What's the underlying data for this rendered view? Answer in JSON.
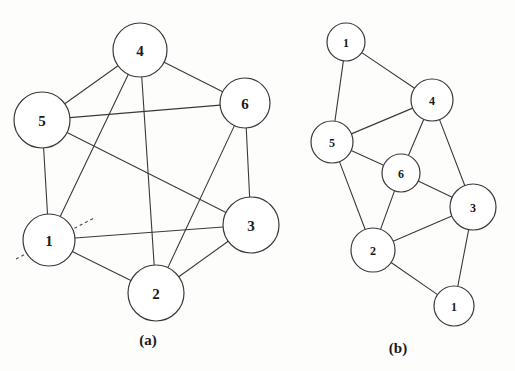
{
  "figure": {
    "background_color": "#fdfdfc",
    "stroke_color": "#3a3a3a",
    "node_fill": "#ffffff",
    "panels": [
      {
        "id": "panel-a",
        "caption": "(a)",
        "caption_pos": {
          "x": 148,
          "y": 345
        },
        "kind": "circular-layout-graph",
        "nodes": [
          {
            "id": "a4",
            "label": "4",
            "cx": 140,
            "cy": 50,
            "r": 27,
            "font_size": 15
          },
          {
            "id": "a5",
            "label": "5",
            "cx": 42,
            "cy": 120,
            "r": 28,
            "font_size": 15
          },
          {
            "id": "a6",
            "label": "6",
            "cx": 245,
            "cy": 103,
            "r": 25,
            "font_size": 15
          },
          {
            "id": "a3",
            "label": "3",
            "cx": 251,
            "cy": 225,
            "r": 28,
            "font_size": 15
          },
          {
            "id": "a1",
            "label": "1",
            "cx": 49,
            "cy": 240,
            "r": 26,
            "font_size": 15
          },
          {
            "id": "a2",
            "label": "2",
            "cx": 156,
            "cy": 293,
            "r": 28,
            "font_size": 15
          }
        ],
        "edges": [
          {
            "from": "a4",
            "to": "a5"
          },
          {
            "from": "a4",
            "to": "a6"
          },
          {
            "from": "a4",
            "to": "a1"
          },
          {
            "from": "a4",
            "to": "a2"
          },
          {
            "from": "a5",
            "to": "a6"
          },
          {
            "from": "a5",
            "to": "a1"
          },
          {
            "from": "a5",
            "to": "a3"
          },
          {
            "from": "a6",
            "to": "a3"
          },
          {
            "from": "a6",
            "to": "a2"
          },
          {
            "from": "a3",
            "to": "a1"
          },
          {
            "from": "a3",
            "to": "a2"
          },
          {
            "from": "a1",
            "to": "a2"
          }
        ],
        "cut_line": {
          "x1": 16,
          "y1": 259,
          "x2": 94,
          "y2": 218,
          "style": "dashed"
        }
      },
      {
        "id": "panel-b",
        "caption": "(b)",
        "caption_pos": {
          "x": 398,
          "y": 353
        },
        "kind": "spring-layout-graph",
        "nodes": [
          {
            "id": "b1t",
            "label": "1",
            "cx": 346,
            "cy": 42,
            "r": 19,
            "font_size": 12
          },
          {
            "id": "b4",
            "label": "4",
            "cx": 432,
            "cy": 100,
            "r": 21,
            "font_size": 12
          },
          {
            "id": "b5",
            "label": "5",
            "cx": 332,
            "cy": 142,
            "r": 21,
            "font_size": 12
          },
          {
            "id": "b6",
            "label": "6",
            "cx": 401,
            "cy": 173,
            "r": 19,
            "font_size": 12
          },
          {
            "id": "b3",
            "label": "3",
            "cx": 473,
            "cy": 207,
            "r": 23,
            "font_size": 12
          },
          {
            "id": "b2",
            "label": "2",
            "cx": 373,
            "cy": 250,
            "r": 22,
            "font_size": 12
          },
          {
            "id": "b1b",
            "label": "1",
            "cx": 454,
            "cy": 306,
            "r": 20,
            "font_size": 12
          }
        ],
        "edges": [
          {
            "from": "b1t",
            "to": "b4"
          },
          {
            "from": "b1t",
            "to": "b5"
          },
          {
            "from": "b4",
            "to": "b5"
          },
          {
            "from": "b4",
            "to": "b6"
          },
          {
            "from": "b4",
            "to": "b3"
          },
          {
            "from": "b5",
            "to": "b6"
          },
          {
            "from": "b5",
            "to": "b2"
          },
          {
            "from": "b6",
            "to": "b2"
          },
          {
            "from": "b6",
            "to": "b3"
          },
          {
            "from": "b3",
            "to": "b2"
          },
          {
            "from": "b3",
            "to": "b1b"
          },
          {
            "from": "b2",
            "to": "b1b"
          }
        ]
      }
    ]
  }
}
